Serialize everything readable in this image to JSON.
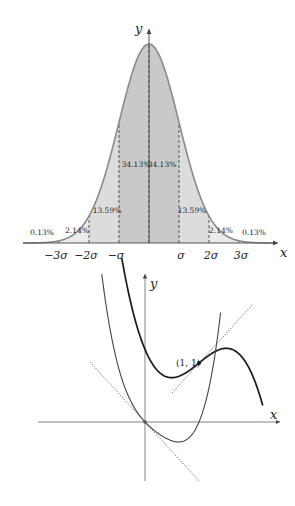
{
  "colors": {
    "band_inner": "#c9c9c9",
    "band_middle": "#dcdcdc",
    "band_outer": "#ebebeb",
    "curve": "#8a8a8a",
    "axis": "#555555",
    "thick_curve": "#1a1a1a",
    "thin_curve": "#444444"
  },
  "normal_chart": {
    "title": "",
    "x_label": "x",
    "y_label": "y",
    "tick_labels": [
      "−3σ",
      "−2σ",
      "−σ",
      "σ",
      "2σ",
      "3σ"
    ],
    "tick_positions_sigma": [
      -3,
      -2,
      -1,
      1,
      2,
      3
    ],
    "bands": [
      {
        "from": -4,
        "to": -3,
        "label": "0.13%"
      },
      {
        "from": -3,
        "to": -2,
        "label": "2.14%"
      },
      {
        "from": -2,
        "to": -1,
        "label": "13.59%"
      },
      {
        "from": -1,
        "to": 0,
        "label": "34.13%"
      },
      {
        "from": 0,
        "to": 1,
        "label": "34.13%"
      },
      {
        "from": 1,
        "to": 2,
        "label": "13.59%"
      },
      {
        "from": 2,
        "to": 3,
        "label": "2.14%"
      },
      {
        "from": 3,
        "to": 4,
        "label": "0.13%"
      }
    ]
  },
  "function_chart": {
    "x_label": "x",
    "y_label": "y",
    "point_label": "(1, 1)",
    "point": [
      1,
      1
    ],
    "curves": [
      {
        "name": "thick-curve",
        "description": "cubic with local min and max, passing (1,1)"
      },
      {
        "name": "thin-curve",
        "description": "curve through origin with minimum below x-axis"
      }
    ],
    "tangents": [
      {
        "name": "tangent-at-point",
        "through": [
          1,
          1
        ]
      },
      {
        "name": "tangent-at-origin",
        "through": [
          0,
          0
        ]
      }
    ]
  }
}
